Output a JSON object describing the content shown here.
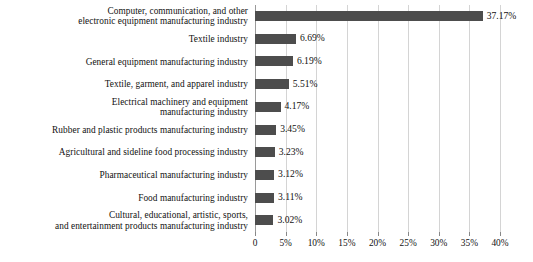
{
  "chart_data": {
    "type": "bar",
    "orientation": "horizontal",
    "title": "",
    "subtitle": "",
    "xlabel": "",
    "ylabel": "",
    "xlim": [
      0,
      40
    ],
    "grid": true,
    "legend": false,
    "bar_color": "#4d4d4d",
    "gridline_color": "#d4d4d4",
    "axis_color": "#9a9a9a",
    "value_suffix": "%",
    "categories": [
      "Computer, communication, and other electronic equipment manufacturing industry",
      "Textile industry",
      "General equipment manufacturing industry",
      "Textile, garment, and apparel industry",
      "Electrical machinery and equipment manufacturing industry",
      "Rubber and plastic products manufacturing industry",
      "Agricultural and sideline food processing industry",
      "Pharmaceutical manufacturing industry",
      "Food manufacturing industry",
      "Cultural, educational, artistic, sports, and entertainment products manufacturing industry"
    ],
    "category_lines": [
      [
        "Computer, communication, and other",
        "electronic equipment manufacturing industry"
      ],
      [
        "Textile industry"
      ],
      [
        "General equipment manufacturing industry"
      ],
      [
        "Textile, garment, and apparel industry"
      ],
      [
        "Electrical machinery and equipment",
        "manufacturing industry"
      ],
      [
        "Rubber and plastic products manufacturing industry"
      ],
      [
        "Agricultural and sideline food processing industry"
      ],
      [
        "Pharmaceutical manufacturing industry"
      ],
      [
        "Food manufacturing industry"
      ],
      [
        "Cultural, educational, artistic, sports,",
        "and entertainment products manufacturing industry"
      ]
    ],
    "values": [
      37.17,
      6.69,
      6.19,
      5.51,
      4.17,
      3.45,
      3.23,
      3.12,
      3.11,
      3.02
    ],
    "value_labels": [
      "37.17%",
      "6.69%",
      "6.19%",
      "5.51%",
      "4.17%",
      "3.45%",
      "3.23%",
      "3.12%",
      "3.11%",
      "3.02%"
    ],
    "x_ticks": [
      0,
      5,
      10,
      15,
      20,
      25,
      30,
      35,
      40
    ],
    "x_tick_labels": [
      "0",
      "5%",
      "10%",
      "15%",
      "20%",
      "25%",
      "30%",
      "35%",
      "40%"
    ]
  }
}
